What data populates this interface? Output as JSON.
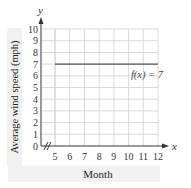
{
  "chart_data": {
    "type": "line",
    "title": "",
    "xlabel": "Month",
    "ylabel": "Average wind speed (mph)",
    "x_axis_name": "x",
    "y_axis_name": "y",
    "x_ticks": [
      "5",
      "6",
      "7",
      "8",
      "9",
      "10",
      "11",
      "12"
    ],
    "y_ticks": [
      "0",
      "1",
      "2",
      "3",
      "4",
      "5",
      "6",
      "7",
      "8",
      "9",
      "10"
    ],
    "xlim": [
      4,
      12
    ],
    "ylim": [
      0,
      10
    ],
    "x_axis_break": true,
    "grid": true,
    "series": [
      {
        "name": "f(x) = 7",
        "x": [
          5,
          6,
          7,
          8,
          9,
          10,
          11,
          12
        ],
        "values": [
          7,
          7,
          7,
          7,
          7,
          7,
          7,
          7
        ]
      }
    ],
    "annotations": [
      {
        "text": "f(x) = 7",
        "x": 10.5,
        "y": 6.1
      }
    ],
    "colors": {
      "line": "#555555",
      "grid": "#d0d0d0",
      "axis": "#333333",
      "band": "#f1f1f1"
    }
  }
}
